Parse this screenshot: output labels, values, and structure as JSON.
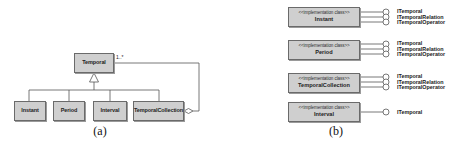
{
  "diagram_a": {
    "caption": "(a)",
    "superclass": {
      "name": "Temporal"
    },
    "subclasses": [
      {
        "name": "Instant"
      },
      {
        "name": "Period"
      },
      {
        "name": "Interval"
      },
      {
        "name": "TemporalCollection"
      }
    ],
    "aggregation": {
      "multiplicity": "1..*",
      "from": "TemporalCollection",
      "to": "Temporal"
    }
  },
  "diagram_b": {
    "caption": "(b)",
    "classes": [
      {
        "stereotype": "<<implementation class>>",
        "name": "Instant",
        "interfaces": [
          "ITemporal",
          "ITemporalRelation",
          "ITemporalOperator"
        ]
      },
      {
        "stereotype": "<<implementation class>>",
        "name": "Period",
        "interfaces": [
          "ITemporal",
          "ITemporalRelation",
          "ITemporalOperator"
        ]
      },
      {
        "stereotype": "<<implementation class>>",
        "name": "TemporalCollection",
        "interfaces": [
          "ITemporal",
          "ITemporalRelation",
          "ITemporalOperator"
        ]
      },
      {
        "stereotype": "<<implementation class>>",
        "name": "Interval",
        "interfaces": [
          "ITemporal"
        ]
      }
    ]
  }
}
